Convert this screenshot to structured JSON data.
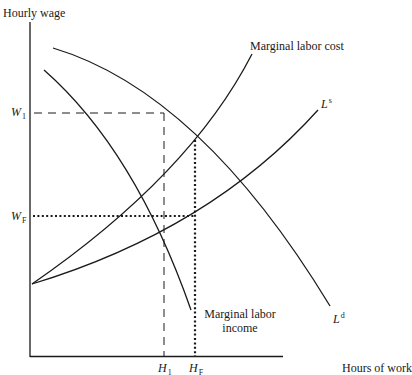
{
  "axes": {
    "y_label": "Hourly wage",
    "x_label": "Hours of work"
  },
  "ticks": {
    "y": [
      {
        "main": "W",
        "sub": "1"
      },
      {
        "main": "W",
        "sub": "F"
      }
    ],
    "x": [
      {
        "main": "H",
        "sub": "1"
      },
      {
        "main": "H",
        "sub": "F"
      }
    ]
  },
  "curves": {
    "marginal_labor_cost": "Marginal labor cost",
    "labor_supply": {
      "main": "L",
      "sup": "s"
    },
    "labor_demand": {
      "main": "L",
      "sup": "d"
    },
    "marginal_labor_income_line1": "Marginal labor",
    "marginal_labor_income_line2": "income"
  },
  "colors": {
    "ink": "#1a1a1a",
    "background": "#ffffff"
  }
}
